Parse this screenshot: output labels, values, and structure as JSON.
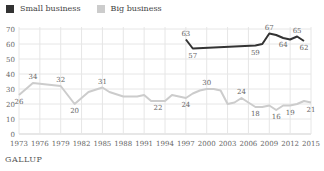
{
  "legend": {
    "items": [
      {
        "label": "Small business",
        "color": "#333333"
      },
      {
        "label": "Big business",
        "color": "#cccccc"
      }
    ]
  },
  "brand": "GALLUP",
  "chart_data": {
    "type": "line",
    "title": "",
    "xlabel": "",
    "ylabel": "",
    "ylim": [
      0,
      70
    ],
    "xlim": [
      1973,
      2015
    ],
    "grid": true,
    "legend_position": "top-left",
    "y_ticks": [
      0,
      10,
      20,
      30,
      40,
      50,
      60,
      70
    ],
    "x_ticks": [
      "1973",
      "1976",
      "1979",
      "1982",
      "1985",
      "1988",
      "1991",
      "1994",
      "1997",
      "2000",
      "2003",
      "2006",
      "2009",
      "2012",
      "2015"
    ],
    "series": [
      {
        "name": "Small business",
        "color": "#333333",
        "x": [
          1997,
          1998,
          2007,
          2008,
          2009,
          2010,
          2011,
          2012,
          2013,
          2014
        ],
        "values": [
          63,
          57,
          59,
          60,
          67,
          66,
          64,
          63,
          65,
          62
        ],
        "labels": [
          {
            "x": 1997,
            "value": 63,
            "text": "63",
            "pos": "above"
          },
          {
            "x": 1998,
            "value": 57,
            "text": "57",
            "pos": "below"
          },
          {
            "x": 2007,
            "value": 59,
            "text": "59",
            "pos": "below"
          },
          {
            "x": 2009,
            "value": 67,
            "text": "67",
            "pos": "above"
          },
          {
            "x": 2011,
            "value": 64,
            "text": "64",
            "pos": "below"
          },
          {
            "x": 2013,
            "value": 65,
            "text": "65",
            "pos": "above"
          },
          {
            "x": 2014,
            "value": 62,
            "text": "62",
            "pos": "below"
          }
        ]
      },
      {
        "name": "Big business",
        "color": "#cccccc",
        "x": [
          1973,
          1975,
          1979,
          1981,
          1983,
          1985,
          1986,
          1988,
          1990,
          1991,
          1992,
          1993,
          1994,
          1995,
          1997,
          1998,
          1999,
          2000,
          2001,
          2002,
          2003,
          2004,
          2005,
          2006,
          2007,
          2008,
          2009,
          2010,
          2011,
          2012,
          2013,
          2014,
          2015
        ],
        "values": [
          26,
          34,
          32,
          20,
          28,
          31,
          28,
          25,
          25,
          26,
          22,
          22,
          22,
          26,
          24,
          27,
          29,
          30,
          30,
          29,
          20,
          21,
          24,
          21,
          18,
          18,
          19,
          16,
          19,
          19,
          20,
          22,
          21
        ],
        "labels": [
          {
            "x": 1973,
            "value": 26,
            "text": "26",
            "pos": "below"
          },
          {
            "x": 1975,
            "value": 34,
            "text": "34",
            "pos": "above"
          },
          {
            "x": 1979,
            "value": 32,
            "text": "32",
            "pos": "above"
          },
          {
            "x": 1981,
            "value": 20,
            "text": "20",
            "pos": "below"
          },
          {
            "x": 1985,
            "value": 31,
            "text": "31",
            "pos": "above"
          },
          {
            "x": 1993,
            "value": 22,
            "text": "22",
            "pos": "below"
          },
          {
            "x": 1997,
            "value": 24,
            "text": "24",
            "pos": "below"
          },
          {
            "x": 2000,
            "value": 30,
            "text": "30",
            "pos": "above"
          },
          {
            "x": 2005,
            "value": 24,
            "text": "24",
            "pos": "above"
          },
          {
            "x": 2007,
            "value": 18,
            "text": "18",
            "pos": "below"
          },
          {
            "x": 2010,
            "value": 16,
            "text": "16",
            "pos": "below"
          },
          {
            "x": 2012,
            "value": 19,
            "text": "19",
            "pos": "below"
          },
          {
            "x": 2015,
            "value": 21,
            "text": "21",
            "pos": "below"
          }
        ]
      }
    ]
  }
}
